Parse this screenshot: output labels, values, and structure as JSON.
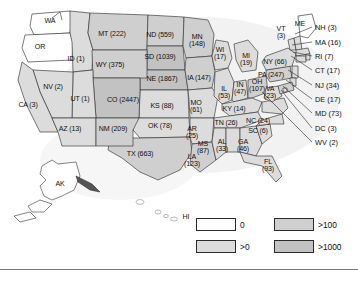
{
  "chart_data": {
    "type": "map",
    "title": "",
    "subtitle": "",
    "map_region": "United States",
    "value_encoding": "choropleth-bins",
    "legend": {
      "position": "bottom-right",
      "entries": [
        {
          "label": "0",
          "color": "#ffffff",
          "order": 1
        },
        {
          "label": ">0",
          "color": "#dcdcdc",
          "order": 2
        },
        {
          "label": ">100",
          "color": "#cfcfcf",
          "order": 3
        },
        {
          "label": ">1000",
          "color": "#c2c2c2",
          "order": 4
        }
      ]
    },
    "bins": [
      {
        "name": "zero",
        "min": 0,
        "max": 0
      },
      {
        "name": "gt0",
        "min": 1,
        "max": 100
      },
      {
        "name": "gt100",
        "min": 101,
        "max": 1000
      },
      {
        "name": "gt1000",
        "min": 1001,
        "max": null
      }
    ],
    "categories": [
      "ID",
      "MT",
      "ND",
      "MN",
      "WI",
      "MI",
      "NV",
      "WY",
      "SD",
      "NE",
      "IA",
      "IL",
      "IN",
      "OH",
      "CA",
      "UT",
      "CO",
      "KS",
      "MO",
      "KY",
      "AZ",
      "NM",
      "OK",
      "AR",
      "TN",
      "NC",
      "SC",
      "MS",
      "AL",
      "GA",
      "TX",
      "LA",
      "FL",
      "NY",
      "PA",
      "VA",
      "VT",
      "NH",
      "MA",
      "RI",
      "CT",
      "NJ",
      "DE",
      "MD",
      "DC",
      "WV",
      "WA",
      "OR",
      "ME",
      "AK",
      "HI"
    ],
    "values": [
      1,
      222,
      559,
      148,
      17,
      19,
      2,
      375,
      1039,
      1867,
      147,
      53,
      47,
      107,
      3,
      1,
      2447,
      88,
      61,
      14,
      13,
      209,
      78,
      25,
      26,
      24,
      6,
      87,
      33,
      46,
      663,
      123,
      93,
      66,
      247,
      23,
      3,
      3,
      16,
      7,
      17,
      34,
      17,
      73,
      3,
      2,
      0,
      0,
      0,
      0,
      0
    ],
    "xlabel": "",
    "ylabel": ""
  },
  "map": {
    "state_labels": [
      {
        "code": "WA",
        "text": "WA",
        "x": 50,
        "y": 22,
        "two": false
      },
      {
        "code": "OR",
        "text": "OR",
        "x": 40,
        "y": 48,
        "two": false
      },
      {
        "code": "ID",
        "text": "ID (1)",
        "x": 76,
        "y": 60,
        "two": false
      },
      {
        "code": "MT",
        "text": "MT (222)",
        "x": 112,
        "y": 35,
        "two": false
      },
      {
        "code": "ND",
        "text": "ND (559)",
        "x": 160,
        "y": 36,
        "two": false
      },
      {
        "code": "MN",
        "text": "MN\n(148)",
        "x": 197,
        "y": 41,
        "two": true
      },
      {
        "code": "WI",
        "text": "WI\n(17)",
        "x": 220,
        "y": 54,
        "two": true
      },
      {
        "code": "MI",
        "text": "MI\n(19)",
        "x": 246,
        "y": 60,
        "two": true
      },
      {
        "code": "NV",
        "text": "NV (2)",
        "x": 53,
        "y": 88,
        "two": false
      },
      {
        "code": "WY",
        "text": "WY (375)",
        "x": 110,
        "y": 66,
        "two": false
      },
      {
        "code": "SD",
        "text": "SD (1039)",
        "x": 160,
        "y": 58,
        "two": false
      },
      {
        "code": "NE",
        "text": "NE (1867)",
        "x": 162,
        "y": 80,
        "two": false
      },
      {
        "code": "IA",
        "text": "IA (147)",
        "x": 199,
        "y": 79,
        "two": false
      },
      {
        "code": "IL",
        "text": "IL\n(53)",
        "x": 224,
        "y": 93,
        "two": true
      },
      {
        "code": "IN",
        "text": "IN\n(47)",
        "x": 240,
        "y": 89,
        "two": true
      },
      {
        "code": "OH",
        "text": "OH\n(107)",
        "x": 257,
        "y": 86,
        "two": true
      },
      {
        "code": "CA",
        "text": "CA (3)",
        "x": 28,
        "y": 106,
        "two": false
      },
      {
        "code": "UT",
        "text": "UT (1)",
        "x": 80,
        "y": 100,
        "two": false
      },
      {
        "code": "CO",
        "text": "CO (2447)",
        "x": 123,
        "y": 101,
        "two": false
      },
      {
        "code": "KS",
        "text": "KS (88)",
        "x": 162,
        "y": 107,
        "two": false
      },
      {
        "code": "MO",
        "text": "MO\n(61)",
        "x": 196,
        "y": 107,
        "two": true
      },
      {
        "code": "KY",
        "text": "KY (14)",
        "x": 234,
        "y": 110,
        "two": false
      },
      {
        "code": "AZ",
        "text": "AZ (13)",
        "x": 70,
        "y": 130,
        "two": false
      },
      {
        "code": "NM",
        "text": "NM (209)",
        "x": 113,
        "y": 130,
        "two": false
      },
      {
        "code": "OK",
        "text": "OK (78)",
        "x": 160,
        "y": 127,
        "two": false
      },
      {
        "code": "AR",
        "text": "AR\n(25)",
        "x": 192,
        "y": 133,
        "two": true
      },
      {
        "code": "TN",
        "text": "TN (26)",
        "x": 226,
        "y": 124,
        "two": false
      },
      {
        "code": "NC",
        "text": "NC (24)",
        "x": 258,
        "y": 122,
        "two": false
      },
      {
        "code": "SC",
        "text": "SC (6)",
        "x": 258,
        "y": 132,
        "two": false
      },
      {
        "code": "MS",
        "text": "MS\n(87)",
        "x": 203,
        "y": 148,
        "two": true
      },
      {
        "code": "AL",
        "text": "AL\n(33)",
        "x": 222,
        "y": 146,
        "two": true
      },
      {
        "code": "GA",
        "text": "GA\n(46)",
        "x": 243,
        "y": 146,
        "two": true
      },
      {
        "code": "TX",
        "text": "TX (663)",
        "x": 140,
        "y": 155,
        "two": false
      },
      {
        "code": "LA",
        "text": "LA\n(123)",
        "x": 192,
        "y": 161,
        "two": true
      },
      {
        "code": "FL",
        "text": "FL\n(93)",
        "x": 268,
        "y": 166,
        "two": true
      },
      {
        "code": "NY",
        "text": "NY (66)",
        "x": 275,
        "y": 63,
        "two": false
      },
      {
        "code": "PA",
        "text": "PA (247)",
        "x": 271,
        "y": 76,
        "two": false
      },
      {
        "code": "VA",
        "text": "VA\n(23)",
        "x": 270,
        "y": 93,
        "two": true
      },
      {
        "code": "VT",
        "text": "VT\n(3)",
        "x": 281,
        "y": 33,
        "two": true
      },
      {
        "code": "ME",
        "text": "ME",
        "x": 300,
        "y": 25,
        "two": false
      },
      {
        "code": "AK",
        "text": "AK",
        "x": 60,
        "y": 185,
        "two": false
      },
      {
        "code": "HI",
        "text": "HI",
        "x": 186,
        "y": 218,
        "two": false
      }
    ],
    "callouts": [
      {
        "code": "NH",
        "text": "NH (3)",
        "x": 315,
        "y": 27,
        "ax": 295,
        "ay": 34
      },
      {
        "code": "MA",
        "text": "MA (16)",
        "x": 315,
        "y": 42,
        "ax": 292,
        "ay": 45
      },
      {
        "code": "RI",
        "text": "RI (7)",
        "x": 315,
        "y": 56,
        "ax": 293,
        "ay": 52
      },
      {
        "code": "CT",
        "text": "CT (17)",
        "x": 315,
        "y": 70,
        "ax": 291,
        "ay": 56
      },
      {
        "code": "NJ",
        "text": "NJ (34)",
        "x": 315,
        "y": 85,
        "ax": 288,
        "ay": 70
      },
      {
        "code": "DE",
        "text": "DE (17)",
        "x": 315,
        "y": 99,
        "ax": 286,
        "ay": 80
      },
      {
        "code": "MD",
        "text": "MD (73)",
        "x": 315,
        "y": 113,
        "ax": 283,
        "ay": 86
      },
      {
        "code": "DC",
        "text": "DC (3)",
        "x": 315,
        "y": 128,
        "ax": 281,
        "ay": 90
      },
      {
        "code": "WV",
        "text": "WV (2)",
        "x": 315,
        "y": 142,
        "ax": 262,
        "ay": 92
      }
    ]
  }
}
